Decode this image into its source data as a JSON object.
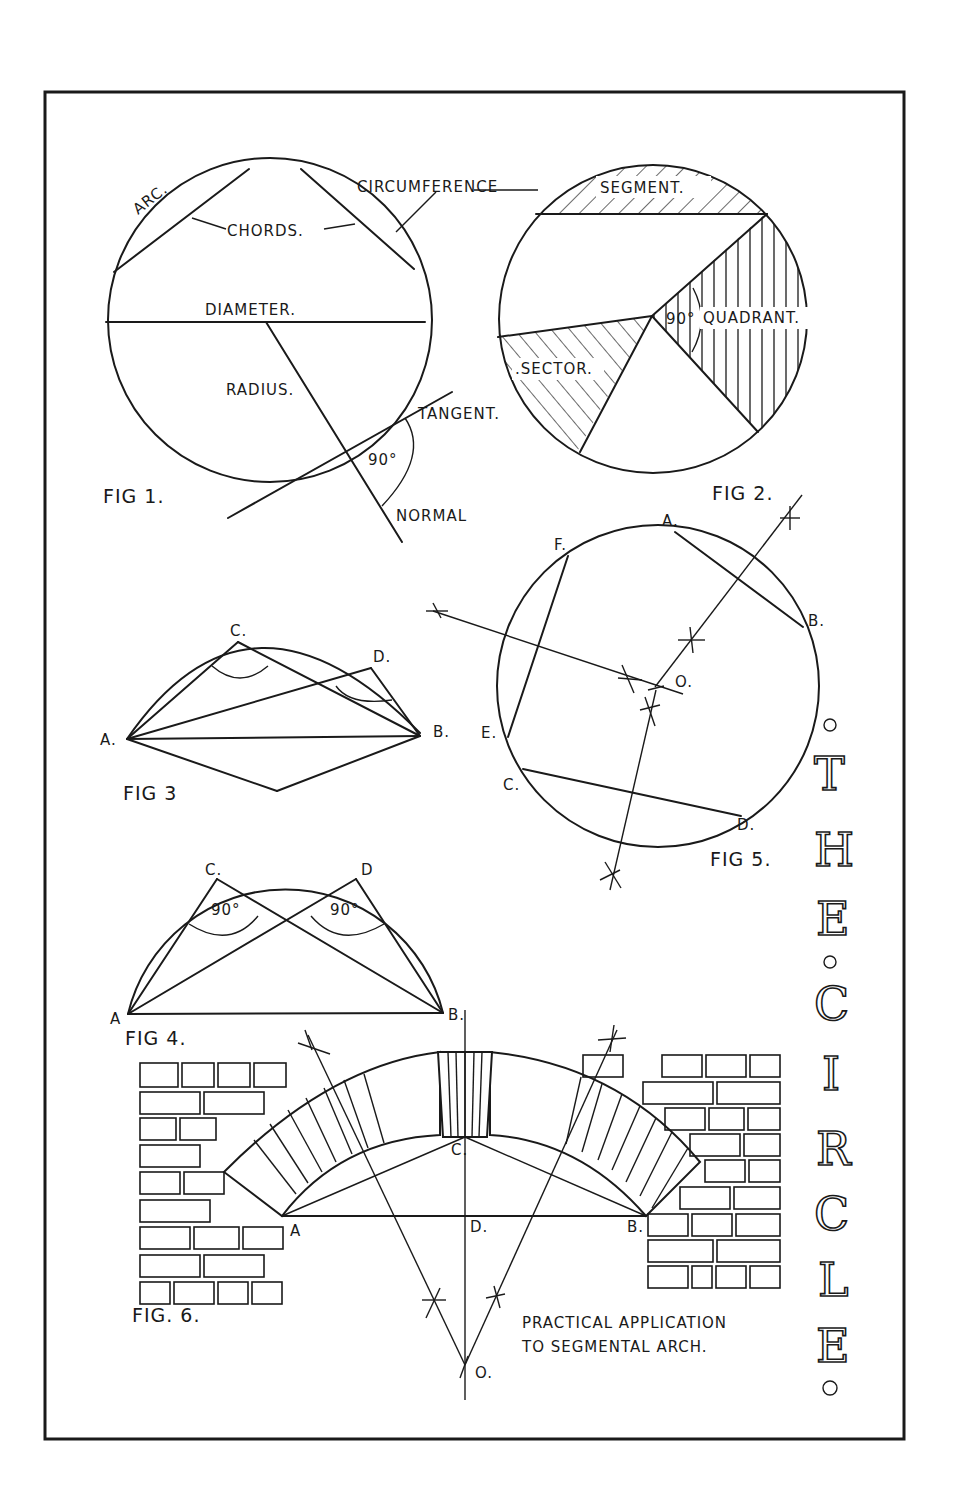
{
  "plate": {
    "title_letters": [
      "T",
      "H",
      "E",
      "C",
      "I",
      "R",
      "C",
      "L",
      "E"
    ],
    "title_text": "THE CIRCLE",
    "ink_color": "#1a1a1a",
    "paper_color": "#ffffff"
  },
  "fig1": {
    "caption": "FIG 1.",
    "labels": {
      "arc": "ARC.",
      "circumference": "CIRCUMFERENCE",
      "chords": "CHORDS.",
      "diameter": "DIAMETER.",
      "radius": "RADIUS.",
      "tangent": "TANGENT.",
      "angle": "90°",
      "normal": "NORMAL"
    }
  },
  "fig2": {
    "caption": "FIG 2.",
    "labels": {
      "segment": "SEGMENT.",
      "quadrant": "QUADRANT.",
      "angle": "90°",
      "sector": ".SECTOR."
    }
  },
  "fig3": {
    "caption": "FIG 3",
    "points": {
      "a": "A.",
      "b": "B.",
      "c": "C.",
      "d": "D."
    }
  },
  "fig4": {
    "caption": "FIG 4.",
    "points": {
      "a": "A",
      "b": "B.",
      "c": "C.",
      "d": "D"
    },
    "angles": [
      "90°",
      "90°"
    ]
  },
  "fig5": {
    "caption": "FIG 5.",
    "points": {
      "a": "A.",
      "b": "B.",
      "c": "C.",
      "d": "D.",
      "e": "E.",
      "f": "F.",
      "o": "O."
    }
  },
  "fig6": {
    "caption": "FIG. 6.",
    "points": {
      "a": "A",
      "b": "B.",
      "c": "C.",
      "d": "D.",
      "o": "O."
    },
    "note_line1": "PRACTICAL APPLICATION",
    "note_line2": "TO SEGMENTAL ARCH."
  }
}
